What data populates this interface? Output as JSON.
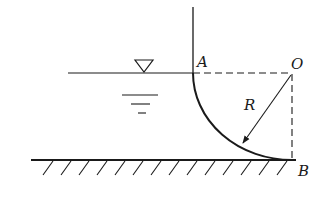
{
  "labels": {
    "A": "A",
    "O": "O",
    "R": "R",
    "B": "B"
  },
  "colors": {
    "stroke": "#1a1a1a",
    "background": "#ffffff"
  },
  "geometry": {
    "wall_x": 193,
    "wall_top_y": 7,
    "water_surface_y": 73,
    "water_surface_start_x": 68,
    "ground_y": 160,
    "ground_start_x": 31,
    "ground_end_x": 296,
    "center_O": [
      292,
      73
    ],
    "point_A": [
      193,
      73
    ],
    "point_B": [
      292,
      160
    ],
    "radius_arrow_end": [
      243,
      143
    ],
    "hatch_count": 14
  },
  "symbols": {
    "free_surface": "inverted-triangle-water-level-symbol"
  }
}
